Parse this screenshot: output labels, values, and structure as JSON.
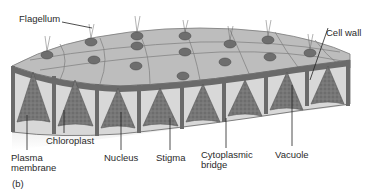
{
  "figure": {
    "panel_label": "(b)"
  },
  "labels": {
    "flagellum": "Flagellum",
    "cell_wall": "Cell wall",
    "chloroplast": "Chloroplast",
    "plasma_membrane_line1": "Plasma",
    "plasma_membrane_line2": "membrane",
    "nucleus": "Nucleus",
    "stigma": "Stigma",
    "cytoplasmic_bridge_line1": "Cytoplasmic",
    "cytoplasmic_bridge_line2": "bridge",
    "vacuole": "Vacuole"
  },
  "colors": {
    "surface": "#b9b9b9",
    "wall": "#6f6f6f",
    "cell_fill": "#7a7a7a",
    "matrix": "#d4d4d4",
    "leader": "#222222"
  }
}
